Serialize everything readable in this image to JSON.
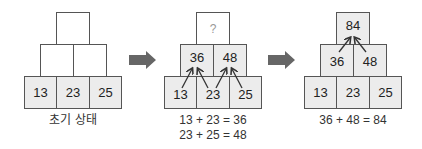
{
  "panels": [
    {
      "title": "초기 상태",
      "top": "",
      "middle": [
        "",
        ""
      ],
      "bottom": [
        "13",
        "23",
        "25"
      ]
    },
    {
      "top": "?",
      "middle": [
        "36",
        "48"
      ],
      "bottom": [
        "13",
        "23",
        "25"
      ],
      "equations": [
        "13 + 23 = 36",
        "23 + 25 = 48"
      ]
    },
    {
      "top": "84",
      "middle": [
        "36",
        "48"
      ],
      "bottom": [
        "13",
        "23",
        "25"
      ],
      "equations": [
        "36 + 48 = 84"
      ]
    }
  ],
  "colors": {
    "box_fill": "#ececec",
    "box_border": "#555555",
    "arrow": "#666666"
  }
}
